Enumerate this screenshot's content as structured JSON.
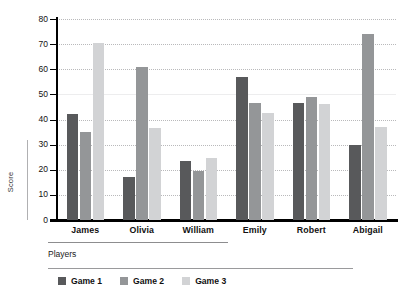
{
  "chart_data": {
    "type": "bar",
    "title": "",
    "xlabel": "Players",
    "ylabel": "Score",
    "ylim": [
      0,
      80
    ],
    "yticks": [
      0,
      10,
      20,
      30,
      40,
      50,
      60,
      70,
      80
    ],
    "grid": true,
    "legend_position": "bottom-left",
    "categories": [
      "James",
      "Olivia",
      "William",
      "Emily",
      "Robert",
      "Abigail"
    ],
    "series": [
      {
        "name": "Game 1",
        "color": "#58595b",
        "values": [
          42,
          17,
          23.5,
          57,
          46.5,
          30
        ]
      },
      {
        "name": "Game 2",
        "color": "#949698",
        "values": [
          35,
          61,
          19.5,
          46.5,
          49,
          74
        ]
      },
      {
        "name": "Game 3",
        "color": "#d2d3d5",
        "values": [
          70.5,
          36.5,
          24.5,
          42.5,
          46,
          37
        ]
      }
    ]
  },
  "axis": {
    "y_title": "Score",
    "x_title": "Players",
    "tick_labels": [
      "80",
      "70",
      "60",
      "50",
      "40",
      "30",
      "20",
      "10",
      "0"
    ]
  },
  "legend": {
    "items": [
      {
        "label": "Game 1",
        "color": "#58595b"
      },
      {
        "label": "Game 2",
        "color": "#949698"
      },
      {
        "label": "Game 3",
        "color": "#d2d3d5"
      }
    ]
  }
}
